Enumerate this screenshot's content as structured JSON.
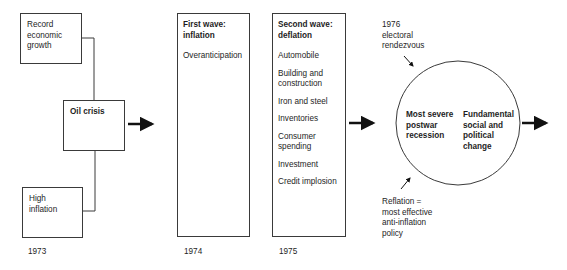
{
  "diagram": {
    "boxes": {
      "record_growth": {
        "label": "Record\neconomic\ngrowth"
      },
      "oil_crisis": {
        "label": "Oil crisis"
      },
      "high_inflation": {
        "label": "High\ninflation"
      },
      "first_wave": {
        "title": "First wave:\ninflation",
        "items": [
          "Overanticipation"
        ]
      },
      "second_wave": {
        "title": "Second wave:\ndeflation",
        "items": [
          "Automobile",
          "Building and\nconstruction",
          "Iron and steel",
          "Inventories",
          "Consumer\nspending",
          "Investment",
          "Credit implosion"
        ]
      }
    },
    "circle": {
      "left_text": "Most severe\npostwar\nrecession",
      "right_text": "Fundamental\nsocial and\npolitical\nchange"
    },
    "annotations": {
      "top": "1976\nelectoral\nrendezvous",
      "bottom": "Reflation  =\nmost effective\nanti-inflation\npolicy"
    },
    "years": [
      "1973",
      "1974",
      "1975"
    ]
  }
}
